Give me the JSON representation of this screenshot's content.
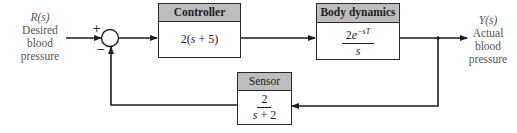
{
  "input": {
    "signal": "R(s)",
    "description_lines": [
      "Desired",
      "blood",
      "pressure"
    ]
  },
  "output": {
    "signal": "Y(s)",
    "description_lines": [
      "Actual",
      "blood",
      "pressure"
    ]
  },
  "summing_junction": {
    "plus_sign": "+",
    "minus_sign": "−"
  },
  "blocks": {
    "controller": {
      "title": "Controller",
      "transfer_function": "2(s + 5)",
      "tf_prefix": "2(",
      "tf_var": "s",
      "tf_suffix": " + 5)"
    },
    "body_dynamics": {
      "title": "Body dynamics",
      "numerator_coef": "2",
      "numerator_base": "e",
      "numerator_exponent": "−sT",
      "denominator": "s"
    },
    "sensor": {
      "title": "Sensor",
      "numerator": "2",
      "denominator_var": "s",
      "denominator_rest": " + 2"
    }
  },
  "colors": {
    "line": "#1e1e1e",
    "header_fill": "#bdbdbd",
    "text": "#555555"
  }
}
